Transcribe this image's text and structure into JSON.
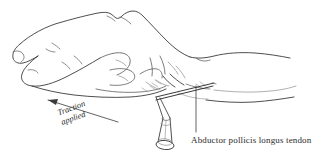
{
  "figure": {
    "kind": "anatomical-line-illustration",
    "background_color": "#ffffff",
    "ink_color": "#3a3a3c",
    "width": 318,
    "height": 160
  },
  "labels": {
    "tendon": {
      "text": "Abductor pollicis longus tendon",
      "leader": "vertical-leader-line"
    },
    "traction": {
      "line1": "Traction",
      "line2": "applied",
      "leader": "arrow-pointing-up-left"
    }
  },
  "parts": {
    "hand": "hand-dorsum-outline",
    "fingers": "curled-fingers",
    "thumb": "thumb",
    "wrist": "wrist-and-forearm",
    "syringe": "syringe-with-needle",
    "needle": "needle-inserted-at-wrist",
    "arrow": "traction-arrow"
  }
}
